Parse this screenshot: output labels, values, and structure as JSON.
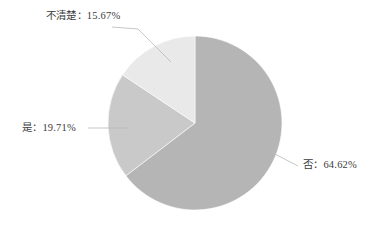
{
  "chart_data": {
    "type": "pie",
    "title": "",
    "subtitle": "",
    "xlabel": "",
    "ylabel": "",
    "legend_position": "none",
    "grid": false,
    "labels_outside": true,
    "start_angle_deg": 0,
    "direction": "clockwise",
    "categories": [
      "否",
      "是",
      "不清楚"
    ],
    "values": [
      64.62,
      19.71,
      15.67
    ],
    "unit": "%",
    "colors": [
      "#b5b5b5",
      "#c9c9c9",
      "#e9e9e9"
    ],
    "slices": [
      {
        "name": "否",
        "value": 64.62,
        "label": "否：64.62%",
        "color": "#b5b5b5",
        "start_deg": 0,
        "end_deg": 232.63
      },
      {
        "name": "是",
        "value": 19.71,
        "label": "是：19.71%",
        "color": "#c9c9c9",
        "start_deg": 232.63,
        "end_deg": 303.59
      },
      {
        "name": "不清楚",
        "value": 15.67,
        "label": "不清楚：15.67%",
        "color": "#e9e9e9",
        "start_deg": 303.59,
        "end_deg": 360
      }
    ]
  },
  "labels": {
    "unclear": "不清楚：15.67%",
    "yes": "是：19.71%",
    "no": "否：64.62%"
  },
  "geometry": {
    "center_x": 195,
    "center_y": 123,
    "radius": 87
  },
  "style": {
    "background": "#ffffff",
    "text_color": "#3c3c3c",
    "leader_color": "#b9b9b9"
  }
}
